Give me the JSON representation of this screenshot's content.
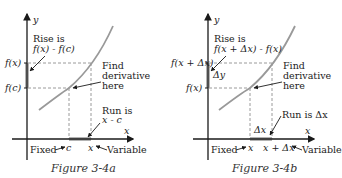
{
  "figures": [
    {
      "caption": "Figure 3-4a",
      "axis_y": "y",
      "axis_x": "x",
      "rise_line1": "Rise is",
      "rise_line2": "f(x) - f(c)",
      "y_tick_top": "f(x)",
      "y_tick_bottom": "f(c)",
      "find_line1": "Find",
      "find_line2": "derivative",
      "find_line3": "here",
      "run_line1": "Run is",
      "run_line2": "x - c",
      "x_tick_fixed": "c",
      "x_tick_variable": "x",
      "fixed_label": "Fixed",
      "variable_label": "Variable"
    },
    {
      "caption": "Figure 3-4b",
      "axis_y": "y",
      "axis_x": "x",
      "rise_line1": "Rise is",
      "rise_line2": "f(x + Δx) - f(x)",
      "y_tick_top": "f(x + Δx)",
      "y_tick_bottom": "f(x)",
      "delta_y": "Δy",
      "find_line1": "Find",
      "find_line2": "derivative",
      "find_line3": "here",
      "run_line1": "Run is Δx",
      "delta_x": "Δx",
      "x_tick_fixed": "x",
      "x_tick_variable": "x + Δx",
      "fixed_label": "Fixed",
      "variable_label": "Variable"
    }
  ],
  "colors": {
    "axis": "#1a1a1a",
    "curve": "#999999",
    "highlight": "#b3b3b3",
    "dashed": "#9a9a9a",
    "text": "#222222"
  }
}
